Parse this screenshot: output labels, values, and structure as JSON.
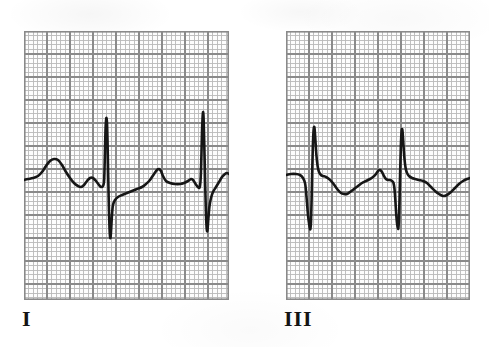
{
  "figure": {
    "background_color": "#ffffff",
    "width": 489,
    "height": 347
  },
  "grid": {
    "minor_cell_px": 4.6,
    "major_every": 5,
    "minor_color": "#b9b9b9",
    "minor_width": 0.9,
    "major_color": "#8a8a8a",
    "major_width": 1.7,
    "border_color": "#8a8a8a",
    "paper_color": "#fdfdfd"
  },
  "trace": {
    "color": "#161616",
    "width": 2.6
  },
  "panels": [
    {
      "id": "lead-i",
      "label": "I",
      "label_x": 22,
      "label_y": 308,
      "x": 24,
      "y": 31,
      "width": 205,
      "height": 269,
      "baseline_y": 180
    },
    {
      "id": "lead-iii",
      "label": "III",
      "label_x": 284,
      "label_y": 308,
      "x": 286,
      "y": 31,
      "width": 184,
      "height": 269,
      "baseline_y": 182
    }
  ],
  "chart_data": {
    "type": "line",
    "subtitle": "Two limb leads recorded on standard ECG graph paper",
    "xlabel": "Time",
    "ylabel": "Voltage",
    "grid": true,
    "legend_position": "none",
    "axis_note": "Standard ECG paper: 1 small box = 0.04 s horizontally, 0.1 mV vertically; 1 large box = 5 small boxes",
    "series": [
      {
        "name": "I",
        "panel": "lead-i",
        "annotations": [
          "P wave",
          "QRS complex",
          "T wave"
        ],
        "beats": 2,
        "points": [
          [
            24,
            180
          ],
          [
            28,
            179
          ],
          [
            33,
            178
          ],
          [
            38,
            176
          ],
          [
            42,
            172
          ],
          [
            46,
            166
          ],
          [
            50,
            161
          ],
          [
            54,
            159
          ],
          [
            58,
            160
          ],
          [
            62,
            165
          ],
          [
            66,
            172
          ],
          [
            70,
            178
          ],
          [
            74,
            183
          ],
          [
            78,
            186
          ],
          [
            81,
            187
          ],
          [
            84,
            185
          ],
          [
            87,
            181
          ],
          [
            90,
            178
          ],
          [
            93,
            178
          ],
          [
            96,
            181
          ],
          [
            99,
            185
          ],
          [
            101,
            187
          ],
          [
            103,
            186
          ],
          [
            104,
            182
          ],
          [
            104.5,
            170
          ],
          [
            105,
            150
          ],
          [
            105.5,
            130
          ],
          [
            106,
            121
          ],
          [
            106.5,
            118
          ],
          [
            107,
            123
          ],
          [
            107.5,
            140
          ],
          [
            108,
            165
          ],
          [
            108.5,
            190
          ],
          [
            109,
            212
          ],
          [
            109.5,
            228
          ],
          [
            110,
            236
          ],
          [
            110.5,
            238
          ],
          [
            111,
            232
          ],
          [
            112,
            215
          ],
          [
            113,
            205
          ],
          [
            115,
            200
          ],
          [
            118,
            197
          ],
          [
            122,
            195
          ],
          [
            127,
            193
          ],
          [
            132,
            191
          ],
          [
            137,
            189
          ],
          [
            142,
            187
          ],
          [
            146,
            184
          ],
          [
            150,
            180
          ],
          [
            154,
            174
          ],
          [
            157,
            170
          ],
          [
            159,
            169
          ],
          [
            161,
            171
          ],
          [
            163,
            176
          ],
          [
            166,
            181
          ],
          [
            170,
            183
          ],
          [
            175,
            184
          ],
          [
            180,
            184
          ],
          [
            184,
            183
          ],
          [
            188,
            181
          ],
          [
            191,
            179
          ],
          [
            193,
            180
          ],
          [
            195,
            183
          ],
          [
            197,
            186
          ],
          [
            199,
            188
          ],
          [
            200,
            186
          ],
          [
            200.8,
            176
          ],
          [
            201.4,
            156
          ],
          [
            202,
            132
          ],
          [
            202.6,
            117
          ],
          [
            203,
            112
          ],
          [
            203.5,
            116
          ],
          [
            204,
            133
          ],
          [
            204.6,
            158
          ],
          [
            205.2,
            185
          ],
          [
            205.8,
            208
          ],
          [
            206.4,
            224
          ],
          [
            207,
            231
          ],
          [
            207.6,
            229
          ],
          [
            208.4,
            218
          ],
          [
            209.5,
            206
          ],
          [
            211,
            198
          ],
          [
            213,
            192
          ],
          [
            216,
            187
          ],
          [
            219,
            182
          ],
          [
            222,
            177
          ],
          [
            225,
            174
          ],
          [
            227,
            173
          ],
          [
            229,
            174
          ]
        ]
      },
      {
        "name": "III",
        "panel": "lead-iii",
        "annotations": [
          "P wave",
          "QRS complex",
          "T wave"
        ],
        "beats": 2,
        "points": [
          [
            286,
            175
          ],
          [
            291,
            174
          ],
          [
            296,
            174
          ],
          [
            300,
            175
          ],
          [
            303,
            178
          ],
          [
            305,
            183
          ],
          [
            306,
            191
          ],
          [
            307,
            203
          ],
          [
            308,
            215
          ],
          [
            309,
            223
          ],
          [
            309.8,
            228
          ],
          [
            310.4,
            229
          ],
          [
            311,
            222
          ],
          [
            311.6,
            200
          ],
          [
            312.2,
            172
          ],
          [
            312.8,
            148
          ],
          [
            313.4,
            133
          ],
          [
            314,
            127
          ],
          [
            314.6,
            129
          ],
          [
            315.4,
            140
          ],
          [
            316.4,
            155
          ],
          [
            317.6,
            166
          ],
          [
            319,
            172
          ],
          [
            321,
            175
          ],
          [
            323,
            176
          ],
          [
            326,
            177
          ],
          [
            329,
            179
          ],
          [
            332,
            182
          ],
          [
            335,
            186
          ],
          [
            338,
            190
          ],
          [
            341,
            193
          ],
          [
            344,
            194
          ],
          [
            347,
            194
          ],
          [
            350,
            192
          ],
          [
            354,
            189
          ],
          [
            358,
            186
          ],
          [
            362,
            183
          ],
          [
            366,
            181
          ],
          [
            370,
            179
          ],
          [
            373,
            177
          ],
          [
            376,
            174
          ],
          [
            378,
            171
          ],
          [
            380,
            170
          ],
          [
            382,
            172
          ],
          [
            384,
            176
          ],
          [
            386,
            179
          ],
          [
            388,
            180
          ],
          [
            390,
            180
          ],
          [
            392,
            181
          ],
          [
            393.5,
            183
          ],
          [
            394.5,
            189
          ],
          [
            395.4,
            201
          ],
          [
            396.2,
            214
          ],
          [
            397,
            223
          ],
          [
            397.8,
            228
          ],
          [
            398.4,
            228
          ],
          [
            399,
            218
          ],
          [
            399.6,
            196
          ],
          [
            400.2,
            170
          ],
          [
            400.8,
            148
          ],
          [
            401.4,
            134
          ],
          [
            402,
            129
          ],
          [
            402.6,
            132
          ],
          [
            403.4,
            144
          ],
          [
            404.4,
            158
          ],
          [
            405.6,
            168
          ],
          [
            407,
            173
          ],
          [
            409,
            176
          ],
          [
            412,
            178
          ],
          [
            415,
            179
          ],
          [
            419,
            180
          ],
          [
            423,
            181
          ],
          [
            427,
            183
          ],
          [
            431,
            187
          ],
          [
            435,
            191
          ],
          [
            439,
            194
          ],
          [
            443,
            196
          ],
          [
            447,
            195
          ],
          [
            451,
            192
          ],
          [
            455,
            188
          ],
          [
            459,
            184
          ],
          [
            463,
            181
          ],
          [
            467,
            179
          ],
          [
            470,
            178
          ]
        ]
      }
    ]
  }
}
